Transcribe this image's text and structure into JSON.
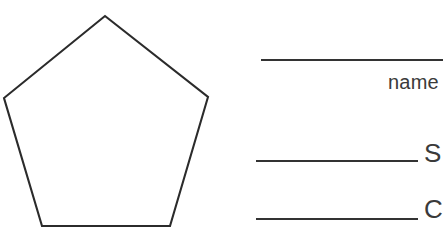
{
  "page": {
    "background_color": "#ffffff",
    "ink_color": "#333333",
    "width": 443,
    "height": 249
  },
  "shape": {
    "name": "pentagon",
    "sides": 5,
    "corners": 5,
    "stroke_color": "#2b2b2b",
    "fill_color": "#ffffff",
    "points": "105,16 208,97 170,226 42,226 4,98"
  },
  "answers": {
    "blanks": [
      {
        "id": "blank-1",
        "value": ""
      },
      {
        "id": "blank-2",
        "value": ""
      },
      {
        "id": "blank-3",
        "value": ""
      }
    ],
    "labels": [
      {
        "id": "label-name",
        "text": "name"
      },
      {
        "id": "label-sides",
        "text": "S"
      },
      {
        "id": "label-corners",
        "text": "C"
      }
    ]
  }
}
